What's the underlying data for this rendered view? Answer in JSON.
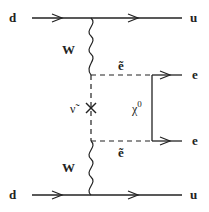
{
  "diagram": {
    "type": "feynman",
    "labels": {
      "top_in": "d",
      "top_out": "u",
      "bottom_in": "d",
      "bottom_out": "u",
      "w_top": "W",
      "w_bottom": "W",
      "selectron_top": "ẽ",
      "selectron_bottom": "ẽ",
      "sneutrino": "ν̃",
      "neutralino": "χ",
      "neutralino_sup": "0",
      "e_top": "e",
      "e_bottom": "e"
    },
    "colors": {
      "line": "#222222",
      "background": "#ffffff"
    }
  }
}
